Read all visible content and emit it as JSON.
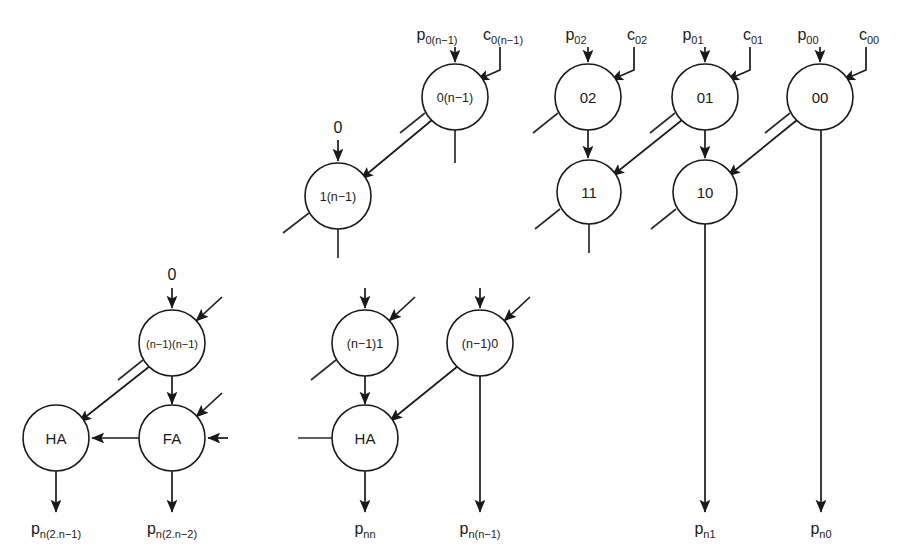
{
  "diagram": {
    "type": "carry-save-multiplier-array-dataflow",
    "background_color": "#ffffff",
    "line_color": "#1a1a1a",
    "nodes": [
      {
        "id": "n_0n1",
        "label": "0(n−1)",
        "cx": 455,
        "cy": 97,
        "r": 33,
        "size": "small"
      },
      {
        "id": "n_02",
        "label": "02",
        "cx": 588,
        "cy": 97,
        "r": 33,
        "size": "normal"
      },
      {
        "id": "n_01",
        "label": "01",
        "cx": 705,
        "cy": 97,
        "r": 33,
        "size": "normal"
      },
      {
        "id": "n_00",
        "label": "00",
        "cx": 820,
        "cy": 97,
        "r": 33,
        "size": "normal"
      },
      {
        "id": "n_1n1",
        "label": "1(n−1)",
        "cx": 338,
        "cy": 196,
        "r": 33,
        "size": "small"
      },
      {
        "id": "n_11",
        "label": "11",
        "cx": 589,
        "cy": 192,
        "r": 32,
        "size": "normal"
      },
      {
        "id": "n_10",
        "label": "10",
        "cx": 705,
        "cy": 192,
        "r": 32,
        "size": "normal"
      },
      {
        "id": "n_nn1nn1",
        "label": "(n−1)(n−1)",
        "cx": 172,
        "cy": 343,
        "r": 33,
        "size": "tiny"
      },
      {
        "id": "n_nn11",
        "label": "(n−1)1",
        "cx": 365,
        "cy": 343,
        "r": 33,
        "size": "small"
      },
      {
        "id": "n_nn10",
        "label": "(n−1)0",
        "cx": 480,
        "cy": 343,
        "r": 33,
        "size": "small"
      },
      {
        "id": "n_ha_l",
        "label": "HA",
        "cx": 56,
        "cy": 438,
        "r": 33,
        "size": "normal"
      },
      {
        "id": "n_fa_l",
        "label": "FA",
        "cx": 172,
        "cy": 438,
        "r": 33,
        "size": "normal"
      },
      {
        "id": "n_ha_m",
        "label": "HA",
        "cx": 365,
        "cy": 438,
        "r": 33,
        "size": "normal"
      }
    ],
    "input_labels": [
      {
        "id": "lbl_p0n1",
        "base": "p",
        "sub": "0(n−1)",
        "x": 437,
        "y": 40
      },
      {
        "id": "lbl_c0n1",
        "base": "c",
        "sub": "0(n−1)",
        "x": 503,
        "y": 40
      },
      {
        "id": "lbl_p02",
        "base": "p",
        "sub": "02",
        "x": 576,
        "y": 40
      },
      {
        "id": "lbl_c02",
        "base": "c",
        "sub": "02",
        "x": 637,
        "y": 40
      },
      {
        "id": "lbl_p01",
        "base": "p",
        "sub": "01",
        "x": 693,
        "y": 40
      },
      {
        "id": "lbl_c01",
        "base": "c",
        "sub": "01",
        "x": 753,
        "y": 40
      },
      {
        "id": "lbl_p00",
        "base": "p",
        "sub": "00",
        "x": 808,
        "y": 40
      },
      {
        "id": "lbl_c00",
        "base": "c",
        "sub": "00",
        "x": 869,
        "y": 40
      }
    ],
    "constant_labels": [
      {
        "id": "const_zero_top",
        "text": "0",
        "x": 338,
        "y": 133
      },
      {
        "id": "const_zero_left",
        "text": "0",
        "x": 172,
        "y": 280
      }
    ],
    "output_labels": [
      {
        "id": "out_pn2n1",
        "base": "p",
        "sub": "n(2.n−1)",
        "x": 56,
        "y": 534
      },
      {
        "id": "out_pn2n2",
        "base": "p",
        "sub": "n(2.n−2)",
        "x": 172,
        "y": 534
      },
      {
        "id": "out_pnn",
        "base": "p",
        "sub": "nn",
        "x": 365,
        "y": 534
      },
      {
        "id": "out_pnn1",
        "base": "p",
        "sub": "n(n−1)",
        "x": 480,
        "y": 534
      },
      {
        "id": "out_pn1",
        "base": "p",
        "sub": "n1",
        "x": 705,
        "y": 534
      },
      {
        "id": "out_pn0",
        "base": "p",
        "sub": "n0",
        "x": 821,
        "y": 534
      }
    ],
    "edges": [
      {
        "id": "e_p0n1_in",
        "kind": "arrow-straight",
        "x1": 455,
        "y1": 47,
        "x2": 455,
        "y2": 62
      },
      {
        "id": "e_c0n1_in",
        "kind": "arrow-elbow",
        "path": "M 500 47 L 500 70 L 477 80",
        "tip": [
          477,
          80
        ],
        "angle": 157
      },
      {
        "id": "e_p02_in",
        "kind": "arrow-straight",
        "x1": 588,
        "y1": 47,
        "x2": 588,
        "y2": 62
      },
      {
        "id": "e_c02_in",
        "kind": "arrow-elbow",
        "path": "M 634 47 L 634 70 L 611 80",
        "tip": [
          611,
          80
        ],
        "angle": 157
      },
      {
        "id": "e_p01_in",
        "kind": "arrow-straight",
        "x1": 705,
        "y1": 47,
        "x2": 705,
        "y2": 62
      },
      {
        "id": "e_c01_in",
        "kind": "arrow-elbow",
        "path": "M 750 47 L 750 70 L 727 80",
        "tip": [
          727,
          80
        ],
        "angle": 157
      },
      {
        "id": "e_p00_in",
        "kind": "arrow-straight",
        "x1": 820,
        "y1": 47,
        "x2": 820,
        "y2": 62
      },
      {
        "id": "e_c00_in",
        "kind": "arrow-elbow",
        "path": "M 866 47 L 866 70 L 843 80",
        "tip": [
          843,
          80
        ],
        "angle": 157
      },
      {
        "id": "e_0n1_to_1n1",
        "kind": "arrow-diag",
        "x1": 432,
        "y1": 120,
        "x2": 361,
        "y2": 179
      },
      {
        "id": "e_02_to_11",
        "kind": "arrow-straight",
        "x1": 588,
        "y1": 130,
        "x2": 588,
        "y2": 158
      },
      {
        "id": "e_01_to_10",
        "kind": "arrow-straight",
        "x1": 705,
        "y1": 130,
        "x2": 705,
        "y2": 158
      },
      {
        "id": "e_01_to_11",
        "kind": "arrow-diag",
        "x1": 682,
        "y1": 120,
        "x2": 612,
        "y2": 176
      },
      {
        "id": "e_00_to_10",
        "kind": "arrow-diag",
        "x1": 797,
        "y1": 120,
        "x2": 728,
        "y2": 176
      },
      {
        "id": "e_zero_to_1n1",
        "kind": "arrow-straight",
        "x1": 338,
        "y1": 140,
        "x2": 338,
        "y2": 161
      },
      {
        "id": "e_zero_to_nn1nn1",
        "kind": "arrow-straight",
        "x1": 172,
        "y1": 288,
        "x2": 172,
        "y2": 308
      },
      {
        "id": "e_nn1nn1_carryin",
        "kind": "arrow-diag",
        "x1": 222,
        "y1": 297,
        "x2": 196,
        "y2": 321
      },
      {
        "id": "e_nn1nn1_to_ha",
        "kind": "arrow-diag",
        "x1": 150,
        "y1": 366,
        "x2": 79,
        "y2": 422
      },
      {
        "id": "e_nn1nn1_to_fa",
        "kind": "arrow-straight",
        "x1": 172,
        "y1": 376,
        "x2": 172,
        "y2": 404
      },
      {
        "id": "e_fa_to_ha",
        "kind": "arrow-left",
        "x1": 139,
        "y1": 438,
        "x2": 92,
        "y2": 438
      },
      {
        "id": "e_fa_in_right",
        "kind": "arrow-left",
        "x1": 228,
        "y1": 438,
        "x2": 208,
        "y2": 438
      },
      {
        "id": "e_fa_in_diag",
        "kind": "arrow-diag",
        "x1": 222,
        "y1": 393,
        "x2": 196,
        "y2": 417
      },
      {
        "id": "e_ha_l_out",
        "kind": "arrow-straight",
        "x1": 56,
        "y1": 471,
        "x2": 56,
        "y2": 512
      },
      {
        "id": "e_fa_l_out",
        "kind": "arrow-straight",
        "x1": 172,
        "y1": 471,
        "x2": 172,
        "y2": 512
      },
      {
        "id": "e_nn11_in_top",
        "kind": "arrow-straight",
        "x1": 365,
        "y1": 288,
        "x2": 365,
        "y2": 308
      },
      {
        "id": "e_nn11_in_diag",
        "kind": "arrow-diag",
        "x1": 415,
        "y1": 297,
        "x2": 389,
        "y2": 321
      },
      {
        "id": "e_nn10_in_top",
        "kind": "arrow-straight",
        "x1": 480,
        "y1": 288,
        "x2": 480,
        "y2": 308
      },
      {
        "id": "e_nn10_in_diag",
        "kind": "arrow-diag",
        "x1": 530,
        "y1": 297,
        "x2": 504,
        "y2": 321
      },
      {
        "id": "e_nn11_to_ha",
        "kind": "arrow-straight",
        "x1": 365,
        "y1": 376,
        "x2": 365,
        "y2": 404
      },
      {
        "id": "e_nn10_to_ha",
        "kind": "arrow-diag",
        "x1": 458,
        "y1": 366,
        "x2": 390,
        "y2": 421
      },
      {
        "id": "e_ha_m_out",
        "kind": "arrow-straight",
        "x1": 365,
        "y1": 471,
        "x2": 365,
        "y2": 512
      },
      {
        "id": "e_nn10_down",
        "kind": "arrow-straight",
        "x1": 480,
        "y1": 376,
        "x2": 480,
        "y2": 512
      },
      {
        "id": "e_10_down",
        "kind": "arrow-straight",
        "x1": 705,
        "y1": 224,
        "x2": 705,
        "y2": 512
      },
      {
        "id": "e_00_down",
        "kind": "arrow-straight",
        "x1": 821,
        "y1": 130,
        "x2": 821,
        "y2": 512
      }
    ],
    "stubs": [
      {
        "id": "s_0n1_bl",
        "x1": 425,
        "y1": 113,
        "x2": 400,
        "y2": 133
      },
      {
        "id": "s_0n1_bot",
        "x1": 455,
        "y1": 130,
        "x2": 455,
        "y2": 163
      },
      {
        "id": "s_02_bl",
        "x1": 558,
        "y1": 113,
        "x2": 533,
        "y2": 133
      },
      {
        "id": "s_01_bl",
        "x1": 675,
        "y1": 113,
        "x2": 650,
        "y2": 133
      },
      {
        "id": "s_00_bl",
        "x1": 790,
        "y1": 113,
        "x2": 765,
        "y2": 133
      },
      {
        "id": "s_1n1_bl",
        "x1": 309,
        "y1": 213,
        "x2": 283,
        "y2": 233
      },
      {
        "id": "s_1n1_bot",
        "x1": 338,
        "y1": 229,
        "x2": 338,
        "y2": 258
      },
      {
        "id": "s_11_bl",
        "x1": 560,
        "y1": 209,
        "x2": 535,
        "y2": 229
      },
      {
        "id": "s_11_bot",
        "x1": 589,
        "y1": 224,
        "x2": 589,
        "y2": 253
      },
      {
        "id": "s_10_bl",
        "x1": 676,
        "y1": 209,
        "x2": 651,
        "y2": 229
      },
      {
        "id": "s_nn1nn1_bl",
        "x1": 143,
        "y1": 360,
        "x2": 118,
        "y2": 380
      },
      {
        "id": "s_nn11_bl",
        "x1": 336,
        "y1": 360,
        "x2": 311,
        "y2": 380
      },
      {
        "id": "s_ha_m_left",
        "x1": 332,
        "y1": 438,
        "x2": 298,
        "y2": 438
      }
    ]
  }
}
